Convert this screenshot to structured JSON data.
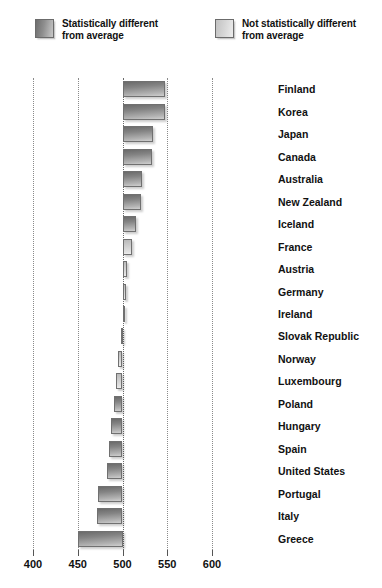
{
  "legend": {
    "items": [
      {
        "label": "Statistically different\nfrom average",
        "swatch": "dark",
        "color": "#8f8f8f"
      },
      {
        "label": "Not statistically different\nfrom average",
        "swatch": "light",
        "color": "#d6d6d6"
      }
    ]
  },
  "chart_data": {
    "type": "bar",
    "orientation": "horizontal",
    "title": "",
    "xlabel": "",
    "ylabel": "",
    "xlim": [
      400,
      600
    ],
    "baseline": 500,
    "xticks": [
      400,
      450,
      500,
      550,
      600
    ],
    "grid": true,
    "legend_position": "top",
    "categories": [
      "Finland",
      "Korea",
      "Japan",
      "Canada",
      "Australia",
      "New Zealand",
      "Iceland",
      "France",
      "Austria",
      "Germany",
      "Ireland",
      "Slovak Republic",
      "Norway",
      "Luxembourg",
      "Poland",
      "Hungary",
      "Spain",
      "United States",
      "Portugal",
      "Italy",
      "Greece"
    ],
    "values": [
      548,
      547,
      534,
      533,
      522,
      521,
      515,
      511,
      505,
      504,
      502,
      498,
      495,
      493,
      490,
      487,
      485,
      483,
      473,
      471,
      450
    ],
    "significance": [
      "significant",
      "significant",
      "significant",
      "significant",
      "significant",
      "significant",
      "significant",
      "not-significant",
      "not-significant",
      "not-significant",
      "not-significant",
      "not-significant",
      "not-significant",
      "not-significant",
      "significant",
      "significant",
      "significant",
      "significant",
      "significant",
      "significant",
      "significant"
    ],
    "series": [
      {
        "name": "Mean score relative to average",
        "values": [
          548,
          547,
          534,
          533,
          522,
          521,
          515,
          511,
          505,
          504,
          502,
          498,
          495,
          493,
          490,
          487,
          485,
          483,
          473,
          471,
          450
        ]
      }
    ]
  }
}
